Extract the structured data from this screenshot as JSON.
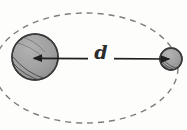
{
  "figure": {
    "background_color": "#fdfdfc",
    "width": 187,
    "height": 130
  },
  "labels": {
    "distance": "d"
  },
  "colors": {
    "body_fill": "#9e9e9e",
    "body_fill_light": "#b0b0b0",
    "body_stroke": "#3a3a3a",
    "hatch_stroke": "#3a3a3a",
    "arrow_stroke": "#1f1f1f",
    "orbit_stroke": "#7d7d7d",
    "label_color": "#2b2b2b"
  },
  "bodies": [
    {
      "name": "primary-body",
      "role": "large sphere",
      "center_x": 35,
      "center_y": 57,
      "radius": 23,
      "fill": "#9e9e9e",
      "shading": "hatched lower-left limb"
    },
    {
      "name": "secondary-body",
      "role": "small sphere",
      "center_x": 171,
      "center_y": 59,
      "radius": 11,
      "fill": "#9e9e9e",
      "shading": "hatched lower-right limb"
    }
  ],
  "orbit": {
    "name": "dashed-orbit-ellipse",
    "style": "dashed",
    "center_x": 86,
    "center_y": 68,
    "radius_x": 92,
    "radius_y": 55,
    "dash_pattern": "6 5",
    "stroke": "#7d7d7d",
    "stroke_width": 1.4
  },
  "measure_arrow": {
    "name": "distance-arrow",
    "from_x": 33,
    "from_y": 58,
    "to_x": 170,
    "to_y": 59,
    "double_headed": true,
    "label": "d",
    "stroke": "#1f1f1f",
    "stroke_width": 1.6
  }
}
